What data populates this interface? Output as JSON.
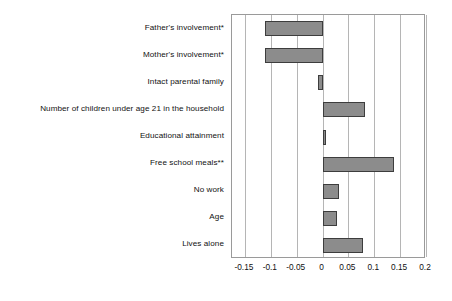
{
  "chart_data": {
    "type": "bar",
    "orientation": "horizontal",
    "title": "",
    "subtitle": "",
    "xlabel": "",
    "ylabel": "",
    "xlim": [
      -0.175,
      0.2
    ],
    "xticks": [
      -0.15,
      -0.1,
      -0.05,
      0,
      0.05,
      0.1,
      0.15,
      0.2
    ],
    "xtick_labels": [
      "-0.15",
      "-0.1",
      "-0.05",
      "0",
      "0.05",
      "0.1",
      "0.15",
      "0.2"
    ],
    "grid": "vertical",
    "legend": "none",
    "categories": [
      "Father's involvement*",
      "Mother's involvement*",
      "Intact parental family",
      "Number of children under age 21 in the household",
      "Educational attainment",
      "Free school meals**",
      "No work",
      "Age",
      "Lives alone"
    ],
    "values": [
      -0.111,
      -0.111,
      -0.008,
      0.082,
      0.003,
      0.139,
      0.031,
      0.028,
      0.079
    ],
    "series": [
      {
        "name": "Coefficient",
        "values": [
          -0.111,
          -0.111,
          -0.008,
          0.082,
          0.003,
          0.139,
          0.031,
          0.028,
          0.079
        ]
      }
    ],
    "bar_fill_color": "#8c8c8c",
    "bar_border_color": "#3d3d3d",
    "gridline_color": "#b5b5b5",
    "frame_color": "#9a9a9a",
    "background_color": "#ffffff"
  }
}
